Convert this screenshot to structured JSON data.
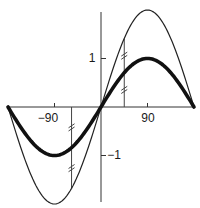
{
  "chart_data": {
    "type": "line",
    "title": "",
    "xlabel": "",
    "ylabel": "",
    "xlim": [
      -180,
      180
    ],
    "ylim": [
      -2,
      2
    ],
    "grid": false,
    "legend": null,
    "x_ticks": [
      {
        "value": -90,
        "label": "−90"
      },
      {
        "value": 90,
        "label": "90"
      }
    ],
    "y_ticks": [
      {
        "value": 1,
        "label": "1"
      },
      {
        "value": -1,
        "label": "−1"
      }
    ],
    "series": [
      {
        "name": "y = sin x",
        "amplitude": 1,
        "style": "thick",
        "stroke": "#111111",
        "width": 3.6,
        "x": [
          -180,
          -135,
          -90,
          -45,
          0,
          45,
          90,
          135,
          180
        ],
        "values": [
          0,
          -0.71,
          -1,
          -0.71,
          0,
          0.71,
          1,
          0.71,
          0
        ]
      },
      {
        "name": "y = 2 sin x",
        "amplitude": 2,
        "style": "thin",
        "stroke": "#222222",
        "width": 1.2,
        "x": [
          -180,
          -135,
          -90,
          -45,
          0,
          45,
          90,
          135,
          180
        ],
        "values": [
          0,
          -1.41,
          -2,
          -1.41,
          0,
          1.41,
          2,
          1.41,
          0
        ]
      }
    ],
    "annotations": [
      {
        "type": "vertical-segment-with-double-ticks",
        "x": 45,
        "from": 0,
        "to": 1.41,
        "note": "equal-length marks showing 2 sin x is double sin x"
      },
      {
        "type": "vertical-segment-with-double-ticks",
        "x": -57,
        "from": 0,
        "to": -1.68,
        "note": "equal-length marks showing 2 sin x is double sin x"
      }
    ]
  },
  "labels": {
    "x_neg90": "−90",
    "x_90": "90",
    "y_1": "1",
    "y_neg1": "−1"
  }
}
